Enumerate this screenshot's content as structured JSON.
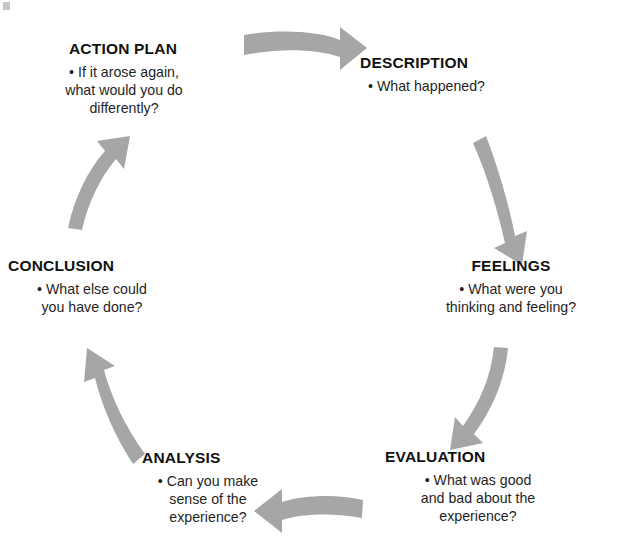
{
  "diagram": {
    "type": "cycle",
    "direction": "clockwise",
    "background_color": "#ffffff",
    "arrow_color": "#a6a6a6",
    "text_color": "#1a1a1a",
    "stages": [
      {
        "id": "action-plan",
        "label": "ACTION PLAN",
        "bullet": "• If it arose again, what would you do differently?",
        "bullet_lines": [
          "• If it arose again,",
          "what would you do",
          "differently?"
        ],
        "position": "top-left"
      },
      {
        "id": "description",
        "label": "DESCRIPTION",
        "bullet": "• What happened?",
        "bullet_lines": [
          "• What happened?"
        ],
        "position": "top-right"
      },
      {
        "id": "feelings",
        "label": "FEELINGS",
        "bullet": "• What were you thinking and feeling?",
        "bullet_lines": [
          "• What were you",
          "thinking and feeling?"
        ],
        "position": "right"
      },
      {
        "id": "evaluation",
        "label": "EVALUATION",
        "bullet": "• What was good and bad about the experience?",
        "bullet_lines": [
          "• What was good",
          "and bad about the",
          "experience?"
        ],
        "position": "bottom-right"
      },
      {
        "id": "analysis",
        "label": "ANALYSIS",
        "bullet": "• Can you make sense of the experience?",
        "bullet_lines": [
          "• Can you make",
          "sense of the",
          "experience?"
        ],
        "position": "bottom-left"
      },
      {
        "id": "conclusion",
        "label": "CONCLUSION",
        "bullet": "• What else could you have done?",
        "bullet_lines": [
          "• What else could",
          "you have done?"
        ],
        "position": "left"
      }
    ],
    "arrows": [
      {
        "id": "arrow-action-plan-to-description",
        "from": "ACTION PLAN",
        "to": "DESCRIPTION",
        "direction": "right"
      },
      {
        "id": "arrow-description-to-feelings",
        "from": "DESCRIPTION",
        "to": "FEELINGS",
        "direction": "down-right"
      },
      {
        "id": "arrow-feelings-to-evaluation",
        "from": "FEELINGS",
        "to": "EVALUATION",
        "direction": "down-left"
      },
      {
        "id": "arrow-evaluation-to-analysis",
        "from": "EVALUATION",
        "to": "ANALYSIS",
        "direction": "left"
      },
      {
        "id": "arrow-analysis-to-conclusion",
        "from": "ANALYSIS",
        "to": "CONCLUSION",
        "direction": "up-left"
      },
      {
        "id": "arrow-conclusion-to-action-plan",
        "from": "CONCLUSION",
        "to": "ACTION PLAN",
        "direction": "up-right"
      }
    ]
  }
}
